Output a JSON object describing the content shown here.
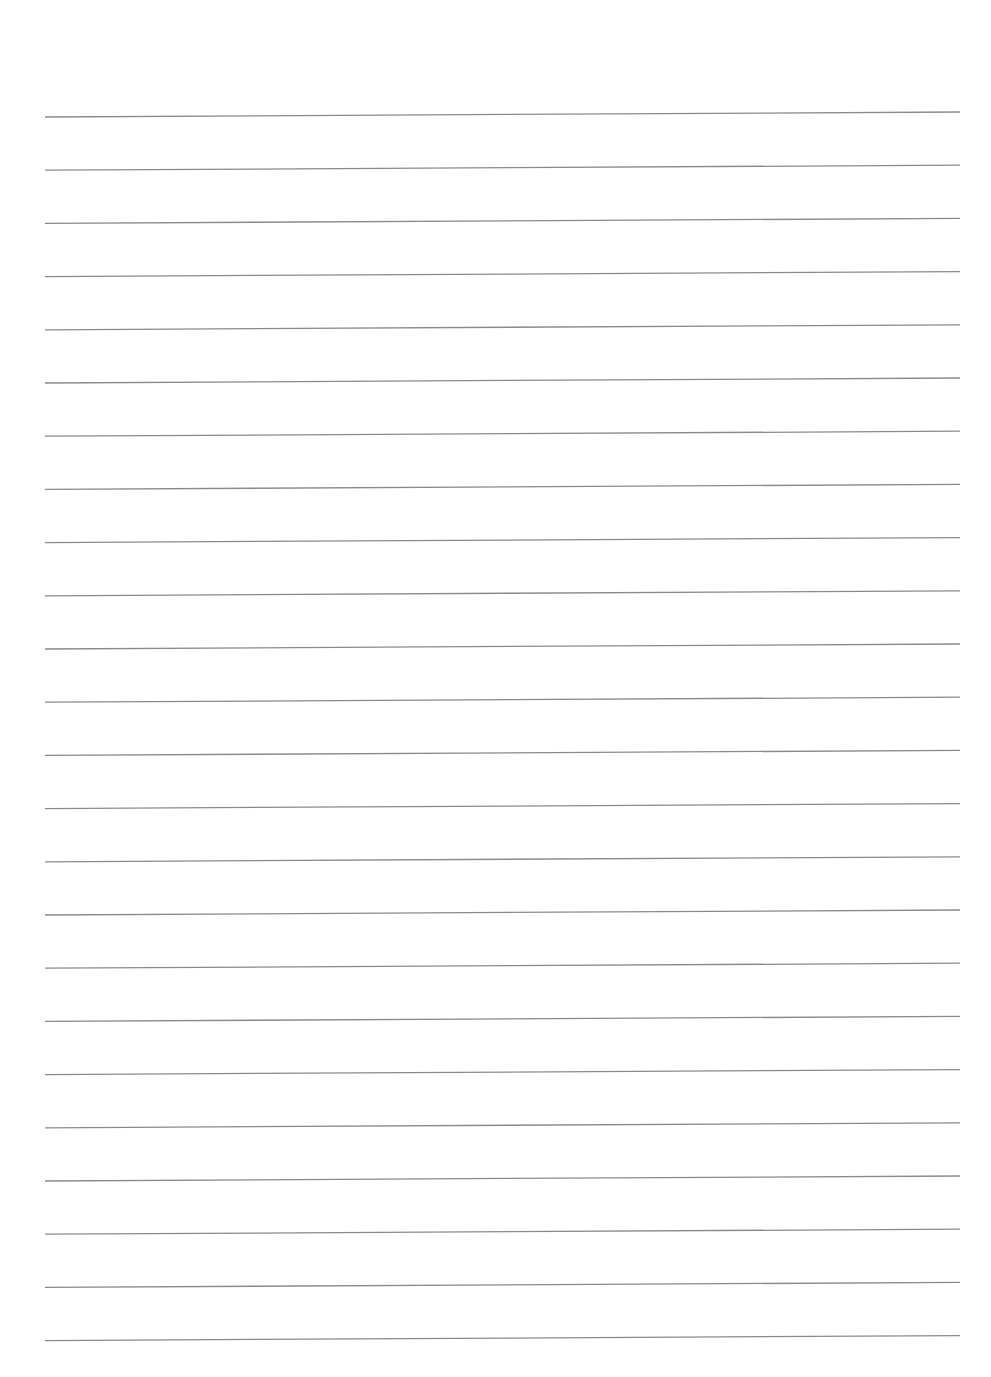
{
  "document": {
    "type": "ruled-lined-paper",
    "background_color": "#ffffff",
    "line_color": "#8a8a8a",
    "line_width": 1.3,
    "line_count": 24,
    "line_start_x": 45,
    "line_end_x": 960,
    "first_line_y_left": 117,
    "first_line_y_right": 112,
    "last_line_y_left": 1341,
    "line_spacing": 53.2
  }
}
